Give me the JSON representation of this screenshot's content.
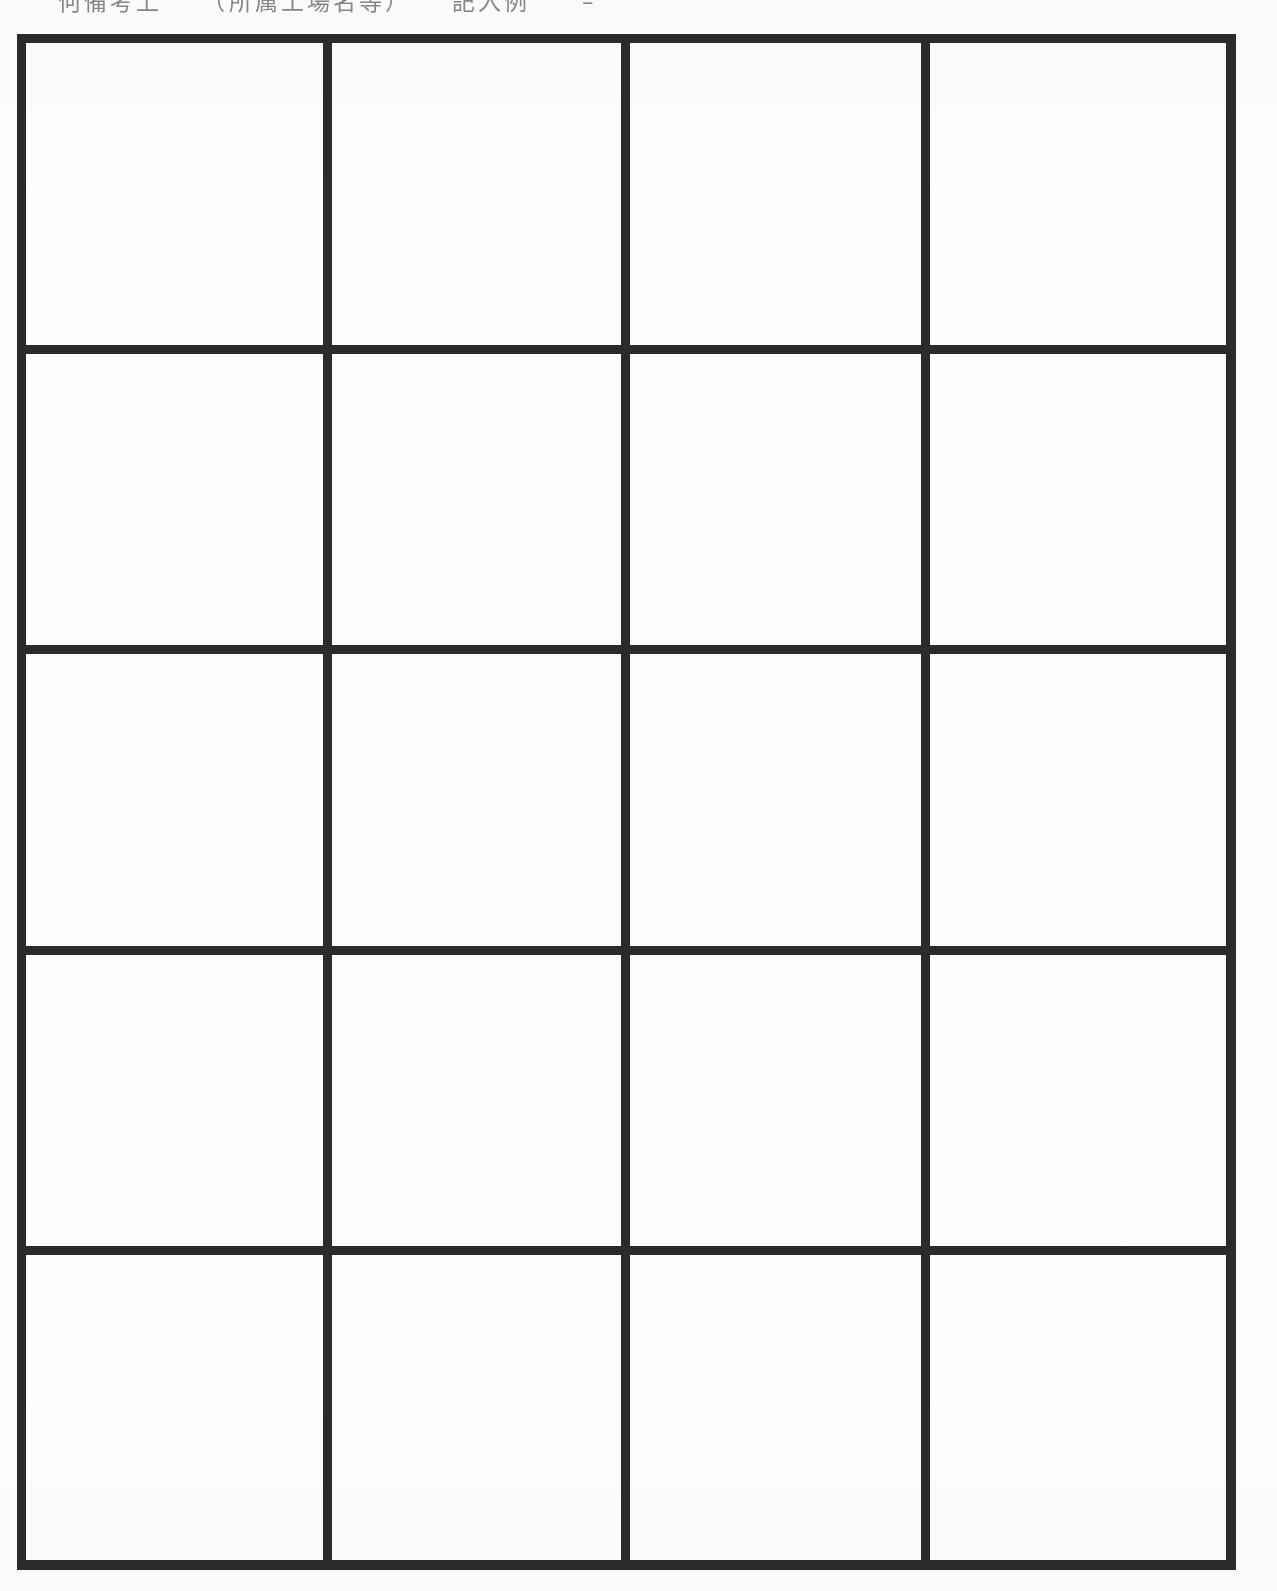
{
  "document": {
    "type": "scanned-page",
    "page_background_color": "#fdfdfc",
    "ink_color": "#2b2b2b",
    "width_px": 1277,
    "height_px": 1591
  },
  "header": {
    "clipped_text_line": "何備考上　　（所属工場名等）　　記入例　　–",
    "note": "top line of scan is cut off by the page crop; only the bottom fragments of the glyphs are visible"
  },
  "table": {
    "rows_count": 5,
    "columns_count": 4,
    "is_blank": true,
    "border_weight_px": 18,
    "grid_bounds": {
      "left": 17,
      "top": 34,
      "right": 1236,
      "bottom": 1570
    },
    "column_divider_x": [
      327,
      629,
      935
    ],
    "row_divider_y": [
      347,
      649,
      952,
      1254
    ],
    "column_widths_px": [
      293,
      285,
      288,
      292
    ],
    "row_heights_px": [
      295,
      285,
      285,
      285,
      298
    ],
    "cells": [
      [
        {
          "text": ""
        },
        {
          "text": ""
        },
        {
          "text": ""
        },
        {
          "text": ""
        }
      ],
      [
        {
          "text": ""
        },
        {
          "text": ""
        },
        {
          "text": ""
        },
        {
          "text": ""
        }
      ],
      [
        {
          "text": ""
        },
        {
          "text": ""
        },
        {
          "text": ""
        },
        {
          "text": ""
        }
      ],
      [
        {
          "text": ""
        },
        {
          "text": ""
        },
        {
          "text": ""
        },
        {
          "text": ""
        }
      ],
      [
        {
          "text": ""
        },
        {
          "text": ""
        },
        {
          "text": ""
        },
        {
          "text": ""
        }
      ]
    ]
  }
}
